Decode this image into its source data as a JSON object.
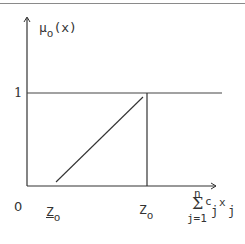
{
  "figure": {
    "y_axis_label": {
      "main": "μ",
      "sub": "o",
      "arg": "(x)"
    },
    "y_tick_one": "1",
    "origin_label": "0",
    "x_labels": {
      "lower_z": {
        "main": "Z",
        "sub": "o",
        "underlined": true
      },
      "upper_z": {
        "main": "Z",
        "sub": "o"
      },
      "x_axis_label": {
        "upper_limit": "n",
        "sigma": "Σ",
        "lower_limit": "j=1",
        "coef": "c",
        "coef_sub": "j",
        "var": "x",
        "var_sub": "j"
      }
    },
    "colors": {
      "line": "#333333",
      "top_rule": "#8a8a8a"
    }
  }
}
